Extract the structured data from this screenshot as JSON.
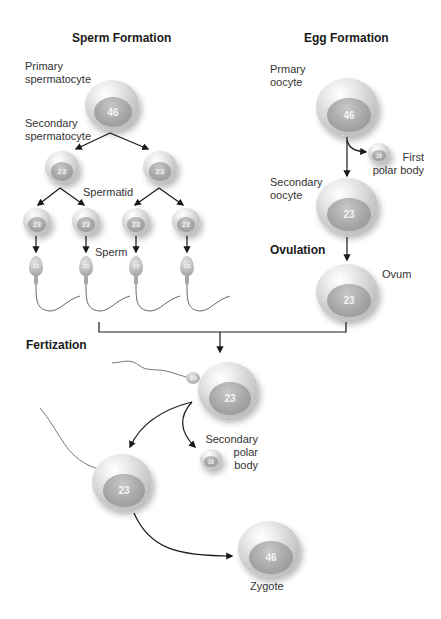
{
  "sperm_formation": {
    "title": "Sperm Formation",
    "labels": {
      "primary": "Primary\nspermatocyte",
      "primary_line1": "Primary",
      "primary_line2": "spermatocyte",
      "secondary_line1": "Secondary",
      "secondary_line2": "spermatocyte",
      "spermatid": "Spermatid",
      "sperm": "Sperm"
    },
    "cells": {
      "primary_spermatocyte": "46",
      "secondary_spermatocytes": [
        "23",
        "23"
      ],
      "spermatids": [
        "23",
        "23",
        "23",
        "23"
      ],
      "sperm": [
        "23",
        "23",
        "23",
        "23"
      ]
    }
  },
  "egg_formation": {
    "title": "Egg Formation",
    "labels": {
      "primary_line1": "Prmary",
      "primary_line2": "oocyte",
      "first_polar_line1": "First",
      "first_polar_line2": "polar body",
      "secondary_line1": "Secondary",
      "secondary_line2": "oocyte",
      "ovulation": "Ovulation",
      "ovum": "Ovum"
    },
    "cells": {
      "primary_oocyte": "46",
      "first_polar_body": "23",
      "secondary_oocyte": "23",
      "ovum": "23"
    }
  },
  "fertilization": {
    "title": "Fertization",
    "labels": {
      "secondary_polar_line1": "Secondary",
      "secondary_polar_line2": "polar",
      "secondary_polar_line3": "body",
      "zygote": "Zygote"
    },
    "cells": {
      "ovum_with_sperm": "23",
      "sperm_head": "23",
      "secondary_polar_body": "23",
      "fused_cell": "23",
      "zygote": "46"
    }
  },
  "colors": {
    "line": "#1a1a1a",
    "cell_light": "#eeeeee",
    "cell_dark": "#a9a9a9",
    "nucleus": "#a6a6a6"
  }
}
